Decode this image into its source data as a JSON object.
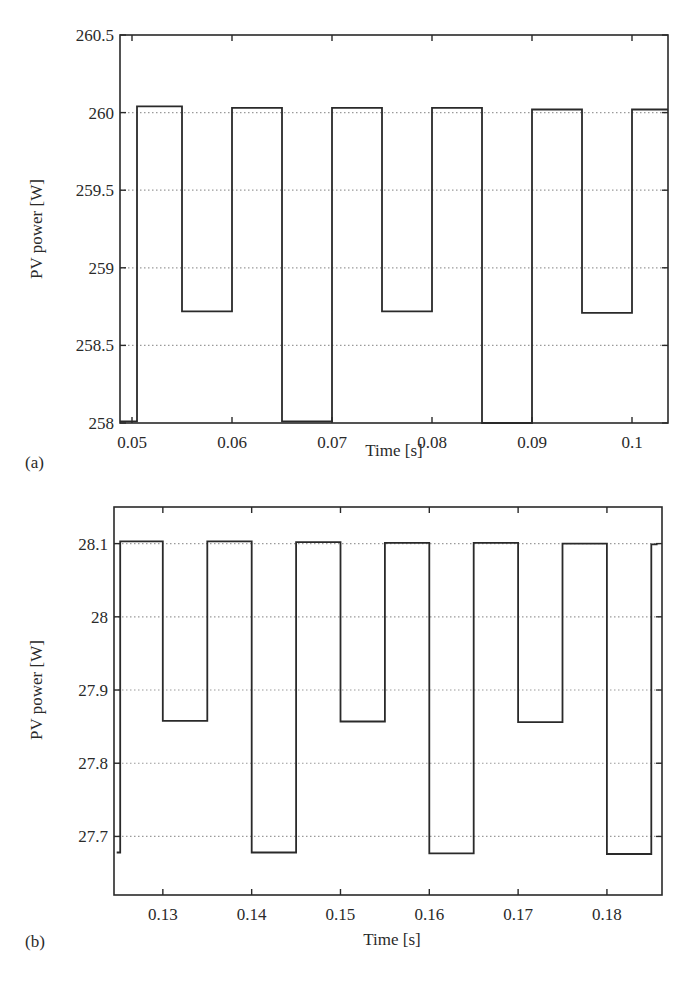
{
  "chart_data": [
    {
      "panel": "(a)",
      "type": "line",
      "step": true,
      "title": "",
      "xlabel": "Time [s]",
      "ylabel": "PV power [W]",
      "xlim": [
        0.0488,
        0.1036
      ],
      "ylim": [
        258,
        260.5
      ],
      "xticks": [
        0.05,
        0.06,
        0.07,
        0.08,
        0.09,
        0.1
      ],
      "xtick_labels": [
        "0.05",
        "0.06",
        "0.07",
        "0.08",
        "0.09",
        "0.1"
      ],
      "yticks": [
        258,
        258.5,
        259,
        259.5,
        260,
        260.5
      ],
      "ytick_labels": [
        "258",
        "258.5",
        "259",
        "259.5",
        "260",
        "260.5"
      ],
      "grid": "horizontal dotted",
      "legend": null,
      "series": [
        {
          "name": "PV power",
          "x": [
            0.0488,
            0.0505,
            0.0505,
            0.055,
            0.055,
            0.06,
            0.06,
            0.065,
            0.065,
            0.07,
            0.07,
            0.075,
            0.075,
            0.08,
            0.08,
            0.085,
            0.085,
            0.09,
            0.09,
            0.095,
            0.095,
            0.1,
            0.1,
            0.1036
          ],
          "y": [
            258.01,
            258.01,
            260.04,
            260.04,
            258.72,
            258.72,
            260.03,
            260.03,
            258.01,
            258.01,
            260.03,
            260.03,
            258.72,
            258.72,
            260.03,
            260.03,
            258.0,
            258.0,
            260.02,
            260.02,
            258.71,
            258.71,
            260.02,
            260.02
          ]
        }
      ]
    },
    {
      "panel": "(b)",
      "type": "line",
      "step": true,
      "title": "",
      "xlabel": "Time [s]",
      "ylabel": "PV power [W]",
      "xlim": [
        0.1245,
        0.1862
      ],
      "ylim": [
        27.62,
        28.15
      ],
      "xticks": [
        0.13,
        0.14,
        0.15,
        0.16,
        0.17,
        0.18
      ],
      "xtick_labels": [
        "0.13",
        "0.14",
        "0.15",
        "0.16",
        "0.17",
        "0.18"
      ],
      "yticks": [
        27.7,
        27.8,
        27.9,
        28.0,
        28.1
      ],
      "ytick_labels": [
        "27.7",
        "27.8",
        "27.9",
        "28",
        "28.1"
      ],
      "grid": "horizontal dotted",
      "legend": null,
      "series": [
        {
          "name": "PV power",
          "x": [
            0.1248,
            0.1252,
            0.1252,
            0.13,
            0.13,
            0.135,
            0.135,
            0.14,
            0.14,
            0.145,
            0.145,
            0.15,
            0.15,
            0.155,
            0.155,
            0.16,
            0.16,
            0.165,
            0.165,
            0.17,
            0.17,
            0.175,
            0.175,
            0.18,
            0.18,
            0.185,
            0.185,
            0.1857
          ],
          "y": [
            27.678,
            27.678,
            28.103,
            28.103,
            27.858,
            27.858,
            28.103,
            28.103,
            27.678,
            27.678,
            28.102,
            28.102,
            27.857,
            27.857,
            28.101,
            28.101,
            27.677,
            27.677,
            28.101,
            28.101,
            27.856,
            27.856,
            28.1,
            28.1,
            27.676,
            27.676,
            28.099,
            28.099
          ]
        }
      ]
    }
  ],
  "figure": {
    "panels": [
      {
        "label": "(a)",
        "xlabel": "Time [s]",
        "ylabel": "PV power [W]",
        "xtick_labels": [
          "0.05",
          "0.06",
          "0.07",
          "0.08",
          "0.09",
          "0.1"
        ],
        "ytick_labels": [
          "258",
          "258.5",
          "259",
          "259.5",
          "260",
          "260.5"
        ]
      },
      {
        "label": "(b)",
        "xlabel": "Time [s]",
        "ylabel": "PV power [W]",
        "xtick_labels": [
          "0.13",
          "0.14",
          "0.15",
          "0.16",
          "0.17",
          "0.18"
        ],
        "ytick_labels": [
          "27.7",
          "27.8",
          "27.9",
          "28",
          "28.1"
        ]
      }
    ],
    "colors": {
      "line": "#2a2a2a",
      "axes": "#2a2a2a",
      "grid": "#9a9a9a",
      "background": "#ffffff"
    }
  }
}
